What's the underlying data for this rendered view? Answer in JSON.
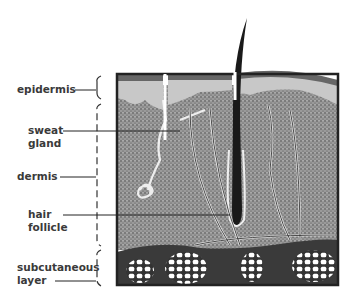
{
  "diagram": {
    "labels": {
      "epidermis": "epidermis",
      "sweat_gland_1": "sweat",
      "sweat_gland_2": "gland",
      "dermis": "dermis",
      "hair_follicle_1": "hair",
      "hair_follicle_2": "follicle",
      "subcutaneous_1": "subcutaneous",
      "subcutaneous_2": "layer"
    },
    "colors": {
      "ink": "#222222",
      "dermis_fill": "#8a8a8a",
      "epidermis_fill": "#c8c8c8",
      "subcutaneous_fill": "#3a3a3a",
      "fat_cells": "#ffffff"
    }
  }
}
